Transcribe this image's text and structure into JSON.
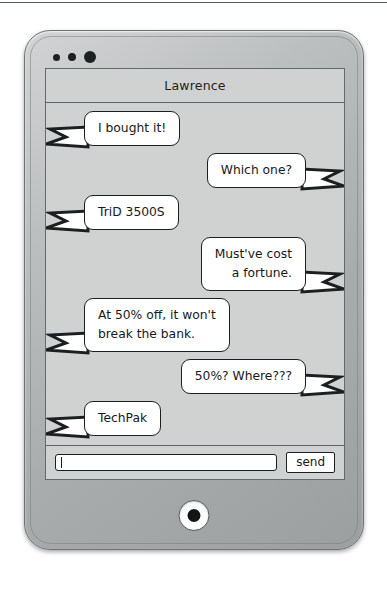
{
  "device": {
    "sensor_dots": [
      "camera-dot-small",
      "camera-dot-medium",
      "camera-dot-large"
    ],
    "home_button_label": "home-button"
  },
  "chat": {
    "header": {
      "title": "Lawrence"
    },
    "messages": [
      {
        "side": "left",
        "lines": [
          "I bought it!"
        ]
      },
      {
        "side": "right",
        "lines": [
          "Which one?"
        ]
      },
      {
        "side": "left",
        "lines": [
          "TriD 3500S"
        ]
      },
      {
        "side": "right",
        "lines": [
          "Must've cost",
          "a fortune."
        ]
      },
      {
        "side": "left",
        "lines": [
          "At 50% off, it won't",
          "break the bank."
        ]
      },
      {
        "side": "right",
        "lines": [
          "50%? Where???"
        ]
      },
      {
        "side": "left",
        "lines": [
          "TechPak"
        ]
      }
    ]
  },
  "composer": {
    "input_value": "",
    "input_placeholder": "",
    "send_label": "send"
  },
  "colors": {
    "bubble_fill": "#ffffff",
    "bubble_stroke": "#1c1f21",
    "screen_bg": "#d0d2d2",
    "bezel": "#a9acad"
  }
}
